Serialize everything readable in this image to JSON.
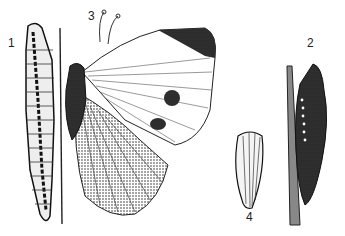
{
  "figure": {
    "labels": [
      {
        "id": "1",
        "text": "1",
        "subject": "caterpillar"
      },
      {
        "id": "2",
        "text": "2",
        "subject": "chrysalis"
      },
      {
        "id": "3",
        "text": "3",
        "subject": "adult butterfly"
      },
      {
        "id": "4",
        "text": "4",
        "subject": "egg"
      }
    ],
    "colors": {
      "ink": "#1a1a1a",
      "paper": "#ffffff",
      "shade": "#555555"
    }
  }
}
